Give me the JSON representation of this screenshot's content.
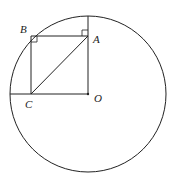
{
  "diagram": {
    "circle": {
      "center": "O",
      "cx": 88,
      "cy": 94,
      "r": 78
    },
    "points": {
      "A": {
        "label": "A",
        "x": 88,
        "y": 36
      },
      "B": {
        "label": "B",
        "x": 31,
        "y": 36
      },
      "C": {
        "label": "C",
        "x": 31,
        "y": 94
      },
      "O": {
        "label": "O",
        "x": 88,
        "y": 94
      }
    },
    "segments": [
      "OA (extended to circle top)",
      "AB",
      "BC",
      "CO (extended to circle left)",
      "AC"
    ],
    "right_angle_marks": [
      "A",
      "B"
    ],
    "colors": {
      "stroke": "#222222",
      "background": "#ffffff"
    }
  }
}
